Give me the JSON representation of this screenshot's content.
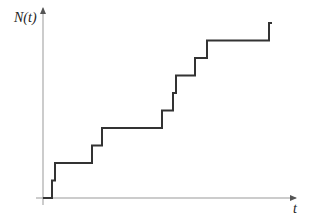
{
  "figure": {
    "y_label": "N(t)",
    "x_label": "t",
    "colors": {
      "axis": "#999999",
      "step_line": "#333333",
      "label": "#222222"
    }
  },
  "chart_data": {
    "type": "line",
    "subtype": "step",
    "title": "",
    "xlabel": "t",
    "ylabel": "N(t)",
    "grid": false,
    "legend": null,
    "tick_labels": {
      "x": [],
      "y": []
    },
    "x": [
      0,
      0.04,
      0.05,
      0.19,
      0.23,
      0.48,
      0.52,
      0.53,
      0.6,
      0.65,
      0.9,
      0.91
    ],
    "values": [
      0,
      1,
      2,
      3,
      4,
      5,
      6,
      7,
      8,
      9,
      10,
      10
    ],
    "event_times_px": [
      52,
      55,
      92,
      102,
      162,
      173,
      176,
      195,
      207,
      269
    ],
    "step_height_px": 17.5,
    "axes_origin_px": [
      43,
      198
    ],
    "x_axis_end_px": 297,
    "y_axis_top_px": 7
  }
}
